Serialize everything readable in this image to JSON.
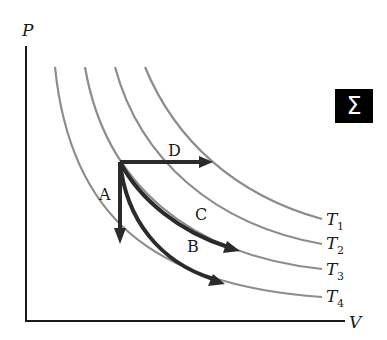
{
  "diagram": {
    "type": "PV diagram",
    "axes": {
      "y_label": "P",
      "x_label": "V"
    },
    "isotherms": [
      {
        "name": "T1",
        "letter": "T",
        "sub": "1",
        "d": "M 145 67 C 175 140, 235 195, 322 219",
        "label_x": 326,
        "label_y": 225,
        "sub_x": 337,
        "sub_y": 230
      },
      {
        "name": "T2",
        "letter": "T",
        "sub": "2",
        "d": "M 115 67 C 140 160, 215 225, 322 244",
        "label_x": 326,
        "label_y": 249,
        "sub_x": 337,
        "sub_y": 254
      },
      {
        "name": "T3",
        "letter": "T",
        "sub": "3",
        "d": "M 85 67 C 105 185, 190 255, 322 269",
        "label_x": 326,
        "label_y": 275,
        "sub_x": 337,
        "sub_y": 280
      },
      {
        "name": "T4",
        "letter": "T",
        "sub": "4",
        "d": "M 55 67 C 70 215, 150 285, 322 297",
        "label_x": 326,
        "label_y": 302,
        "sub_x": 337,
        "sub_y": 307
      }
    ],
    "processes": [
      {
        "name": "A",
        "label": "A",
        "d": "M 120 162 L 120 232",
        "head": "120,244 114,228 126,228",
        "label_x": 99,
        "label_y": 200
      },
      {
        "name": "B",
        "label": "B",
        "d": "M 120 162 C 126 220, 160 262, 213 279",
        "head": "225,284 208,286 213,274",
        "label_x": 187,
        "label_y": 252
      },
      {
        "name": "C",
        "label": "C",
        "d": "M 120 162 C 140 200, 180 232, 228 247",
        "head": "240,251 223,253 227,241",
        "label_x": 195,
        "label_y": 220
      },
      {
        "name": "D",
        "label": "D",
        "d": "M 120 162 L 201 162",
        "head": "213,162 199,156 199,168",
        "label_x": 168,
        "label_y": 156
      }
    ],
    "badge": {
      "symbol": "Σ"
    }
  }
}
